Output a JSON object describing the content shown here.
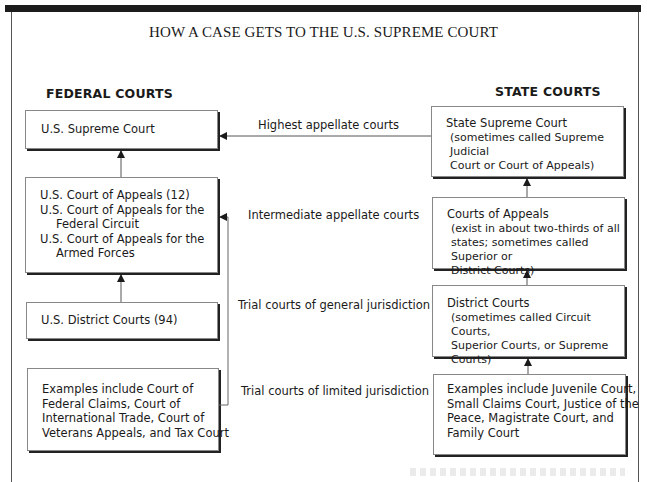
{
  "title": "HOW A CASE GETS TO THE U.S. SUPREME COURT",
  "federal": {
    "heading": "FEDERAL COURTS",
    "boxes": [
      {
        "id": "us-supreme-court",
        "lines": [
          "U.S. Supreme Court"
        ]
      },
      {
        "id": "us-court-of-appeals",
        "lines": [
          "U.S. Court of Appeals (12)",
          "U.S. Court of Appeals for the",
          "Federal Circuit",
          "U.S. Court of Appeals for the",
          "Armed Forces"
        ]
      },
      {
        "id": "us-district-courts",
        "lines": [
          "U.S. District Courts (94)"
        ]
      },
      {
        "id": "federal-limited-courts",
        "lines": [
          "Examples include Court of",
          "Federal Claims, Court of",
          "International Trade, Court of",
          "Veterans Appeals, and Tax Court"
        ]
      }
    ]
  },
  "state": {
    "heading": "STATE COURTS",
    "boxes": [
      {
        "id": "state-supreme-court",
        "name": "State Supreme Court",
        "notes": [
          "(sometimes called Supreme Judicial",
          "Court or Court of Appeals)"
        ]
      },
      {
        "id": "state-courts-of-appeals",
        "name": "Courts of Appeals",
        "notes": [
          "(exist in about two-thirds of all",
          "states; sometimes called Superior or",
          "District Courts)"
        ]
      },
      {
        "id": "state-district-courts",
        "name": "District Courts",
        "notes": [
          "(sometimes called Circuit Courts,",
          "Superior Courts, or Supreme Courts)"
        ]
      },
      {
        "id": "state-limited-courts",
        "lines": [
          "Examples include Juvenile Court,",
          "Small Claims Court, Justice of the",
          "Peace, Magistrate Court, and",
          "Family Court"
        ]
      }
    ]
  },
  "levels": [
    "Highest appellate courts",
    "Intermediate appellate courts",
    "Trial courts of general jurisdiction",
    "Trial courts of limited jurisdiction"
  ],
  "colors": {
    "frame": "#1c1c1c",
    "line": "#555555",
    "box_shadow": "#222222",
    "background": "#ffffff"
  }
}
